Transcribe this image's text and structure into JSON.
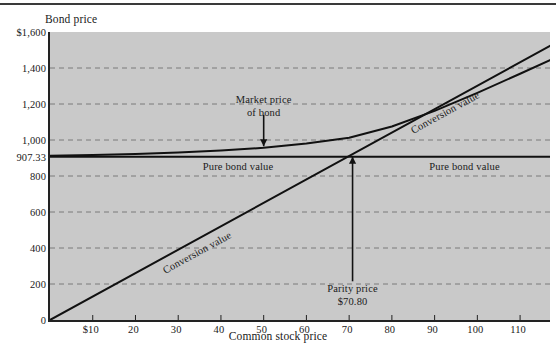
{
  "figure": {
    "y_axis_title": "Bond price",
    "x_axis_title": "Common stock price"
  },
  "annotations": {
    "market_price_line1": "Market price",
    "market_price_line2": "of bond",
    "pure_bond_value_left": "Pure bond value",
    "pure_bond_value_right": "Pure bond value",
    "conversion_value_lower": "Conversion value",
    "conversion_value_upper": "Conversion value",
    "parity_price_line1": "Parity price",
    "parity_price_line2": "$70.80"
  },
  "colors": {
    "plot_background": "#c9c9c9",
    "axis": "#222222",
    "gridline": "#7a7a7a",
    "curve": "#111111",
    "page_background": "#ffffff"
  },
  "chart_data": {
    "type": "line",
    "title": "",
    "xlabel": "Common stock price",
    "ylabel": "Bond price",
    "xlim": [
      0,
      117
    ],
    "ylim": [
      0,
      1600
    ],
    "grid": true,
    "legend": "none",
    "xticks": [
      10,
      20,
      30,
      40,
      50,
      60,
      70,
      80,
      90,
      100,
      110
    ],
    "xtick_labels": [
      "$10",
      "20",
      "30",
      "40",
      "50",
      "60",
      "70",
      "80",
      "90",
      "100",
      "110"
    ],
    "yticks": [
      0,
      200,
      400,
      600,
      800,
      907.33,
      1000,
      1200,
      1400,
      1600
    ],
    "ytick_labels": [
      "0",
      "200",
      "400",
      "600",
      "800",
      "907.33",
      "1,000",
      "1,200",
      "1,400",
      "$1,600"
    ],
    "gridline_values": [
      200,
      400,
      600,
      800,
      1000,
      1200,
      1400
    ],
    "parity_price": 70.8,
    "pure_bond_value": 907.33,
    "series": [
      {
        "name": "Pure bond value",
        "type": "horizontal-line",
        "value": 907.33,
        "x": [
          0,
          117
        ],
        "values": [
          907.33,
          907.33
        ]
      },
      {
        "name": "Conversion value",
        "type": "line",
        "x": [
          0,
          117
        ],
        "values": [
          0,
          1523
        ]
      },
      {
        "name": "Market price of bond",
        "type": "curve",
        "x": [
          0,
          10,
          20,
          30,
          40,
          50,
          60,
          70,
          80,
          90,
          100,
          110,
          117
        ],
        "values": [
          912,
          916,
          922,
          930,
          941,
          957,
          980,
          1012,
          1075,
          1162,
          1262,
          1368,
          1444
        ]
      }
    ],
    "annotations": [
      {
        "text": "Market price of bond",
        "x": 50,
        "y": 1190,
        "arrow_to_y": 960
      },
      {
        "text": "Pure bond value",
        "x": 44,
        "y": 880
      },
      {
        "text": "Pure bond value",
        "x": 97,
        "y": 880
      },
      {
        "text": "Conversion value",
        "x": 33,
        "y": 400,
        "rotated": true
      },
      {
        "text": "Conversion value",
        "x": 92,
        "y": 1180,
        "rotated": true
      },
      {
        "text": "Parity price $70.80",
        "x": 70.8,
        "y": 160,
        "arrow_to_y": 907.33
      }
    ]
  }
}
